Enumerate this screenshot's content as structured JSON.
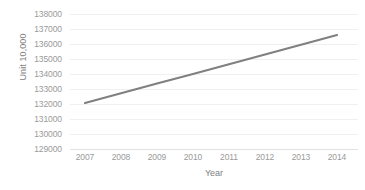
{
  "chart_data": {
    "type": "line",
    "title": "",
    "xlabel": "Year",
    "ylabel": "Unit 10,000",
    "categories": [
      "2007",
      "2008",
      "2009",
      "2010",
      "2011",
      "2012",
      "2013",
      "2014"
    ],
    "x": [
      2007,
      2008,
      2009,
      2010,
      2011,
      2012,
      2013,
      2014
    ],
    "values": [
      132070,
      132720,
      133370,
      134000,
      134650,
      135300,
      135950,
      136600
    ],
    "series": [
      {
        "name": "Unit 10,000",
        "values": [
          132070,
          132720,
          133370,
          134000,
          134650,
          135300,
          135950,
          136600
        ],
        "color": "#808080"
      }
    ],
    "yticks": [
      129000,
      130000,
      131000,
      132000,
      133000,
      134000,
      135000,
      136000,
      137000,
      138000
    ],
    "yticklabels": [
      "129000",
      "130000",
      "131000",
      "132000",
      "133000",
      "134000",
      "135000",
      "136000",
      "137000",
      "138000"
    ],
    "ylim": [
      129000,
      138000
    ],
    "xlim": [
      2007,
      2014
    ],
    "grid": true,
    "grid_axis": "y",
    "legend": false,
    "legend_position": "none",
    "line_color": "#808080",
    "grid_color": "#f0f0f0",
    "tick_label_color": "#9a9a9a",
    "axis_title_color": "#808080",
    "background": "#ffffff",
    "line_width": 2.2,
    "markers": false
  }
}
